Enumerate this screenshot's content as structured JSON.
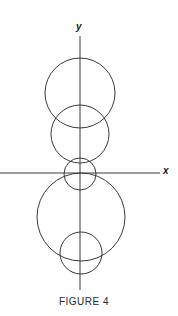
{
  "figure": {
    "caption": "FIGURE 4",
    "stroke_color": "#3a3a3a",
    "axes": {
      "x_label": "x",
      "y_label": "y",
      "origin": {
        "x": 80,
        "y": 173
      },
      "x_axis": {
        "x1": 0,
        "x2": 160,
        "y": 173
      },
      "y_axis": {
        "x": 80,
        "y1": 36,
        "y2": 290
      }
    },
    "circles": [
      {
        "name": "circle-top-large",
        "cx": 80,
        "cy": 93,
        "r": 35
      },
      {
        "name": "circle-upper-middle",
        "cx": 80,
        "cy": 134,
        "r": 29
      },
      {
        "name": "circle-origin-small",
        "cx": 80,
        "cy": 174,
        "r": 16
      },
      {
        "name": "circle-lower-large",
        "cx": 81,
        "cy": 217,
        "r": 44
      },
      {
        "name": "circle-bottom-small",
        "cx": 81,
        "cy": 253,
        "r": 21
      }
    ]
  }
}
